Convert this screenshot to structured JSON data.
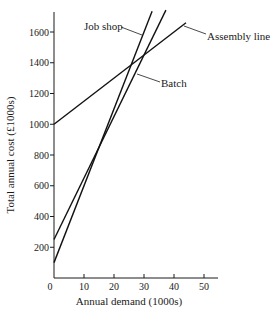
{
  "chart_data": {
    "type": "line",
    "title": "",
    "xlabel": "Annual demand (1000s)",
    "ylabel": "Total annual cost (£1000s)",
    "xlim": [
      0,
      55
    ],
    "ylim": [
      0,
      1700
    ],
    "xticks": [
      0,
      10,
      20,
      30,
      40,
      50
    ],
    "xtick_labels": [
      "0",
      "10",
      "20",
      "30",
      "40",
      "50"
    ],
    "yticks": [
      200,
      400,
      600,
      800,
      1000,
      1200,
      1400,
      1600
    ],
    "ytick_labels": [
      "200",
      "400",
      "600",
      "800",
      "1000",
      "1200",
      "1400",
      "1600"
    ],
    "grid": false,
    "legend": "inline labels",
    "series": [
      {
        "name": "Job shop",
        "x": [
          0,
          32.7
        ],
        "y": [
          100,
          1735
        ],
        "fixed_cost": 100,
        "variable_cost_per_unit": 50
      },
      {
        "name": "Batch",
        "x": [
          0,
          37.3
        ],
        "y": [
          250,
          1742
        ],
        "fixed_cost": 250,
        "variable_cost_per_unit": 40
      },
      {
        "name": "Assembly line",
        "x": [
          0,
          44
        ],
        "y": [
          1000,
          1660
        ],
        "fixed_cost": 1000,
        "variable_cost_per_unit": 15
      }
    ],
    "color": "#111111"
  }
}
